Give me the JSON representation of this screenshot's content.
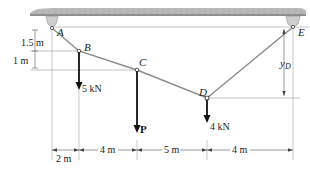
{
  "diagram": {
    "points": {
      "A": {
        "label": "A"
      },
      "B": {
        "label": "B"
      },
      "C": {
        "label": "C"
      },
      "D": {
        "label": "D"
      },
      "E": {
        "label": "E"
      }
    },
    "loads": {
      "B": "5 kN",
      "C": "P",
      "D": "4 kN"
    },
    "vertical_dims": {
      "A_to_B": "1.5 m",
      "B_to_C": "1 m",
      "E_to_D": "y",
      "E_to_D_sub": "D"
    },
    "horizontal_dims": [
      "2 m",
      "4 m",
      "5 m",
      "4 m"
    ],
    "colors": {
      "cable": "#8a8a8a",
      "ceiling": "#b5b5b5",
      "support": "#c8c8c8",
      "dim_line": "#555555",
      "arrow": "#111111"
    }
  }
}
